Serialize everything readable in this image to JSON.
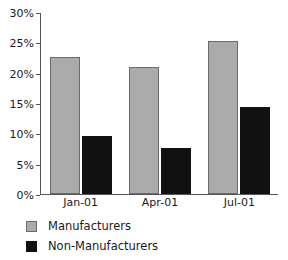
{
  "chart_data": {
    "type": "bar",
    "title": "",
    "xlabel": "",
    "ylabel": "",
    "categories": [
      "Jan-01",
      "Apr-01",
      "Jul-01"
    ],
    "series": [
      {
        "name": "Manufacturers",
        "color": "#ababab",
        "values": [
          22.5,
          21.0,
          25.3
        ]
      },
      {
        "name": "Non-Manufacturers",
        "color": "#111111",
        "values": [
          9.5,
          7.5,
          14.3
        ]
      }
    ],
    "ylim": [
      0,
      30
    ],
    "ytick_values": [
      0,
      5,
      10,
      15,
      20,
      25,
      30
    ],
    "ytick_labels": [
      "0%",
      "5%",
      "10%",
      "15%",
      "20%",
      "25%",
      "30%"
    ],
    "grid": false,
    "legend_position": "bottom-left",
    "value_suffix": "%"
  }
}
